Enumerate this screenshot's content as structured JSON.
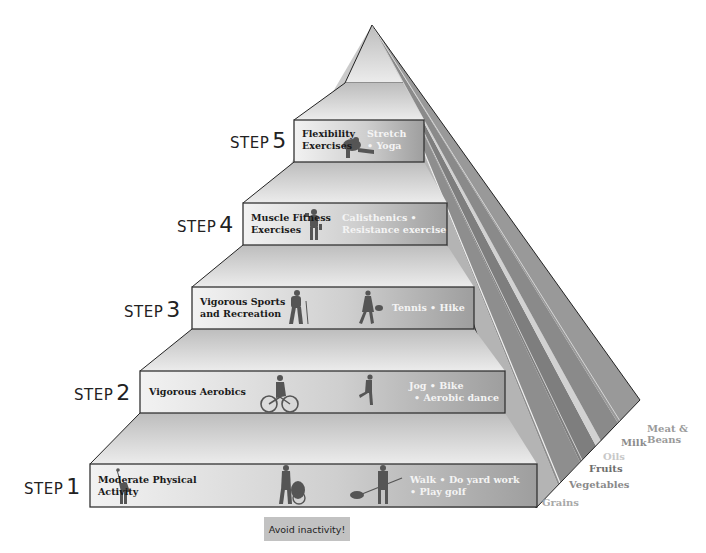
{
  "pyramid": {
    "steps": [
      {
        "step_word": "STEP",
        "number": "1",
        "title_line1": "Moderate Physical",
        "title_line2": "Activity",
        "activities_line1": "Walk • Do yard work",
        "activities_line2": "• Play golf",
        "icons": [
          "golfer-icon",
          "person-pushing-wheelchair-icon",
          "person-raking-leaves-icon"
        ]
      },
      {
        "step_word": "STEP",
        "number": "2",
        "title_line1": "Vigorous Aerobics",
        "title_line2": "",
        "activities_line1": "Jog • Bike",
        "activities_line2": "• Aerobic dance",
        "icons": [
          "cyclist-icon",
          "runner-icon"
        ]
      },
      {
        "step_word": "STEP",
        "number": "3",
        "title_line1": "Vigorous Sports",
        "title_line2": "and Recreation",
        "activities_line1": "Tennis • Hike",
        "activities_line2": "",
        "icons": [
          "hiker-icon",
          "tennis-player-icon"
        ]
      },
      {
        "step_word": "STEP",
        "number": "4",
        "title_line1": "Muscle Fitness",
        "title_line2": "Exercises",
        "activities_line1": "Calisthenics •",
        "activities_line2": "Resistance exercise",
        "icons": [
          "weightlifter-icon"
        ]
      },
      {
        "step_word": "STEP",
        "number": "5",
        "title_line1": "Flexibility",
        "title_line2": "Exercises",
        "activities_line1": "Stretch",
        "activities_line2": "• Yoga",
        "icons": [
          "stretching-person-icon"
        ]
      }
    ],
    "footer": {
      "avoid_label": "Avoid inactivity!"
    },
    "food_groups": [
      {
        "label": "Grains",
        "color": "#a8a8a8"
      },
      {
        "label": "Vegetables",
        "color": "#8a8a8a"
      },
      {
        "label": "Fruits",
        "color": "#6e6e6e"
      },
      {
        "label": "Oils",
        "color": "#c8c8c8"
      },
      {
        "label": "Milk",
        "color": "#8c8c8c"
      },
      {
        "label": "Meat &",
        "color": "#9a9a9a"
      },
      {
        "label": "Beans",
        "color": "#9a9a9a"
      }
    ]
  }
}
